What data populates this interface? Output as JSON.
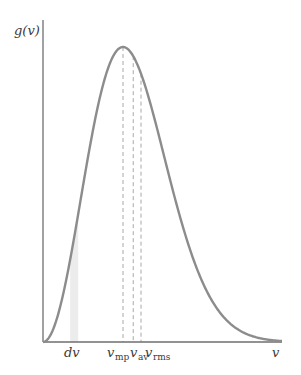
{
  "chart_data": {
    "type": "line",
    "title": "",
    "xlabel": "v",
    "ylabel": "g(v)",
    "function": "g(v) ∝ v^2 · exp(-v^2 / v_mp^2)",
    "grid": false,
    "legend": "none",
    "series": [
      {
        "name": "g(v)",
        "color": "#8c8c8c",
        "x": [
          0,
          0.25,
          0.5,
          0.75,
          1.0,
          1.25,
          1.5,
          1.75,
          2.0,
          2.25,
          2.5,
          2.75,
          3.0
        ],
        "values": [
          0,
          0.17,
          0.58,
          0.95,
          1.0,
          0.83,
          0.54,
          0.29,
          0.13,
          0.05,
          0.016,
          0.004,
          0.001
        ]
      }
    ],
    "markers": [
      {
        "name": "v_mp",
        "label": "v",
        "subscript": "mp",
        "x": 1.0,
        "style": "dashed"
      },
      {
        "name": "v_av",
        "label": "v",
        "subscript": "av",
        "x": 1.128,
        "style": "dashed"
      },
      {
        "name": "v_rms",
        "label": "v",
        "subscript": "rms",
        "x": 1.225,
        "style": "dashed"
      }
    ],
    "shaded_strip": {
      "label": "dv",
      "x_start": 0.34,
      "x_end": 0.44,
      "color": "#ececec"
    },
    "xlim": [
      0,
      3.0
    ],
    "ylim": [
      0,
      1.0
    ]
  },
  "labels": {
    "y_axis": "g(v)",
    "x_axis": "v",
    "dv": "dv",
    "v_mp_main": "v",
    "v_mp_sub": "mp",
    "v_av_main": "v",
    "v_av_sub": "av",
    "v_rms_main": "v",
    "v_rms_sub": "rms"
  },
  "colors": {
    "axis": "#6e6e6e",
    "curve": "#8c8c8c",
    "dashed": "#a8a8a8",
    "strip": "#ececec"
  }
}
